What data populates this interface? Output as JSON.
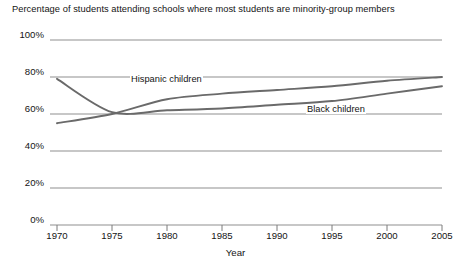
{
  "chart_data": {
    "type": "line",
    "title": "Percentage of students attending schools where most students are minority-group members",
    "xlabel": "Year",
    "ylabel": "",
    "x": [
      1970,
      1975,
      1980,
      1985,
      1990,
      1995,
      2000,
      2005
    ],
    "xticklabels": [
      "1970",
      "1975",
      "1980",
      "1985",
      "1990",
      "1995",
      "2000",
      "2005"
    ],
    "yticklabels": [
      "0%",
      "20%",
      "40%",
      "60%",
      "80%",
      "100%"
    ],
    "yticks": [
      0,
      20,
      40,
      60,
      80,
      100
    ],
    "xlim": [
      1970,
      2005
    ],
    "ylim": [
      0,
      100
    ],
    "grid": true,
    "legend_position": "inline-annotation",
    "series": [
      {
        "name": "Black children",
        "label": "Black children",
        "color": "#6a6a6a",
        "values": [
          79,
          61,
          62,
          63,
          65,
          67,
          71,
          75
        ]
      },
      {
        "name": "Hispanic children",
        "label": "Hispanic children",
        "color": "#6a6a6a",
        "values": [
          55,
          60,
          68,
          71,
          73,
          75,
          78,
          80
        ]
      }
    ],
    "annotations": [
      {
        "text": "Hispanic children",
        "x": 1981,
        "y": 76
      },
      {
        "text": "Black children",
        "x": 1994,
        "y": 65
      }
    ]
  }
}
